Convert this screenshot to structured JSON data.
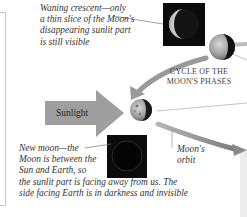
{
  "diagram": {
    "title_line1": "Cycle of the",
    "title_line2": "Moon's phases",
    "captions": {
      "waning_crescent": [
        "Waning crescent—only",
        "a thin slice of the Moon's",
        "disappearing sunlit part",
        "is still visible"
      ],
      "new_moon": [
        "New moon—the",
        "Moon is between the",
        "Sun and Earth, so",
        "the sunlit part is facing away from us. The",
        "side facing Earth is in darkness and invisible"
      ],
      "moons_orbit": [
        "Moon's",
        "orbit"
      ]
    },
    "sunlight_label": "Sunlight",
    "colors": {
      "arrow_gray": "#9a9a9a",
      "orbit_gray": "#8c8c8c",
      "box_black": "#0b0b0b",
      "text": "#333333"
    },
    "elements": [
      "waning-crescent-image",
      "earth",
      "new-moon-image",
      "sunlight-arrow",
      "orbit-arrow",
      "moon-far-right"
    ]
  }
}
